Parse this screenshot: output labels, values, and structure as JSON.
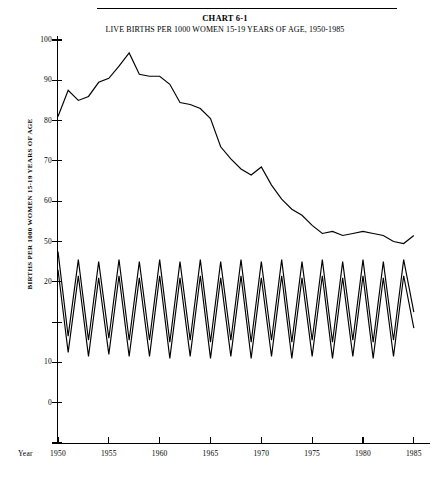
{
  "title": {
    "main": "CHART 6-1",
    "sub": "LIVE BIRTHS PER 1000 WOMEN 15-19 YEARS OF AGE, 1950-1985"
  },
  "axes": {
    "y_axis_label": "BIRTHS PER 1000 WOMEN 15-19 YEARS OF AGE",
    "x_axis_caption": "Year",
    "y_ticks": [
      "100",
      "90",
      "80",
      "70",
      "60",
      "50",
      "20",
      "10",
      "0"
    ],
    "x_ticks": [
      "1950",
      "1955",
      "1960",
      "1965",
      "1970",
      "1975",
      "1980",
      "1985"
    ]
  },
  "colors": {
    "ink": "#000000",
    "paper": "#ffffff"
  },
  "chart_data": {
    "type": "line",
    "xlabel": "Year",
    "ylabel": "BIRTHS PER 1000 WOMEN 15-19 YEARS OF AGE",
    "xlim": [
      1950,
      1986
    ],
    "ylim": [
      0,
      100
    ],
    "grid": false,
    "legend": "none",
    "x": [
      1950,
      1951,
      1952,
      1953,
      1954,
      1955,
      1956,
      1957,
      1958,
      1959,
      1960,
      1961,
      1962,
      1963,
      1964,
      1965,
      1966,
      1967,
      1968,
      1969,
      1970,
      1971,
      1972,
      1973,
      1974,
      1975,
      1976,
      1977,
      1978,
      1979,
      1980,
      1981,
      1982,
      1983,
      1984,
      1985
    ],
    "series": [
      {
        "name": "All live births per 1000 women 15-19",
        "values": [
          81.0,
          87.5,
          85.0,
          86.0,
          89.5,
          90.5,
          93.5,
          96.8,
          91.5,
          91.0,
          91.0,
          89.0,
          84.5,
          84.0,
          83.0,
          80.5,
          73.5,
          70.5,
          68.0,
          66.5,
          68.5,
          64.0,
          60.5,
          58.0,
          56.5,
          54.0,
          52.0,
          52.5,
          51.5,
          52.0,
          52.5,
          52.0,
          51.5,
          50.0,
          49.5,
          51.5
        ]
      },
      {
        "name": "Upper zigzag series",
        "values": [
          47.5,
          26.5,
          45.5,
          25.5,
          45.0,
          26.0,
          45.5,
          25.5,
          45.0,
          25.5,
          45.5,
          25.0,
          45.0,
          25.5,
          45.5,
          25.0,
          45.0,
          25.5,
          45.5,
          25.0,
          45.0,
          25.5,
          45.5,
          25.0,
          45.0,
          25.5,
          45.5,
          25.0,
          45.0,
          25.5,
          45.5,
          25.0,
          45.0,
          25.5,
          45.5,
          32.5
        ]
      },
      {
        "name": "Lower zigzag series",
        "values": [
          43.0,
          22.5,
          41.5,
          21.5,
          41.0,
          22.0,
          41.5,
          21.5,
          41.0,
          21.5,
          41.5,
          21.0,
          41.0,
          21.5,
          41.5,
          21.0,
          41.0,
          21.5,
          41.5,
          21.0,
          41.0,
          21.5,
          41.5,
          21.0,
          41.0,
          21.5,
          41.5,
          21.0,
          41.0,
          21.5,
          41.5,
          21.0,
          41.0,
          21.5,
          41.5,
          28.5
        ]
      }
    ]
  }
}
